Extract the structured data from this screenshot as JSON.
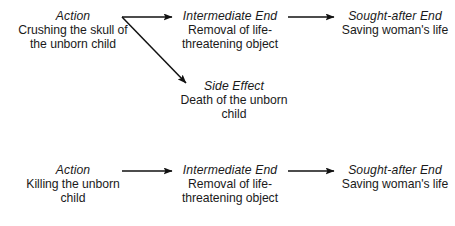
{
  "diagram": {
    "type": "flow-diagram",
    "background_color": "#ffffff",
    "text_color": "#1a1a1a",
    "rows": [
      {
        "id": "row-craniotomy",
        "nodes": [
          {
            "id": "action-1",
            "title": "Action",
            "body": "Crushing the skull of the unborn child"
          },
          {
            "id": "intermediate-end-1",
            "title": "Intermediate End",
            "body": "Removal of life-threatening object"
          },
          {
            "id": "sought-after-end-1",
            "title": "Sought-after End",
            "body": "Saving woman's life"
          },
          {
            "id": "side-effect-1",
            "title": "Side Effect",
            "body": "Death of the unborn child"
          }
        ]
      },
      {
        "id": "row-killing",
        "nodes": [
          {
            "id": "action-2",
            "title": "Action",
            "body": "Killing the unborn child"
          },
          {
            "id": "intermediate-end-2",
            "title": "Intermediate End",
            "body": "Removal of life-threatening object"
          },
          {
            "id": "sought-after-end-2",
            "title": "Sought-after End",
            "body": "Saving woman's life"
          }
        ]
      }
    ],
    "arrows": [
      {
        "id": "arrow-action1-to-intermediate1",
        "from": "action-1",
        "to": "intermediate-end-1",
        "x1": 122,
        "y1": 17,
        "x2": 172,
        "y2": 17
      },
      {
        "id": "arrow-action1-to-sideeffect1",
        "from": "action-1",
        "to": "side-effect-1",
        "x1": 122,
        "y1": 17,
        "x2": 186,
        "y2": 83
      },
      {
        "id": "arrow-intermediate1-to-sought1",
        "from": "intermediate-end-1",
        "to": "sought-after-end-1",
        "x1": 288,
        "y1": 17,
        "x2": 334,
        "y2": 17
      },
      {
        "id": "arrow-action2-to-intermediate2",
        "from": "action-2",
        "to": "intermediate-end-2",
        "x1": 122,
        "y1": 171,
        "x2": 172,
        "y2": 171
      },
      {
        "id": "arrow-intermediate2-to-sought2",
        "from": "intermediate-end-2",
        "to": "sought-after-end-2",
        "x1": 288,
        "y1": 171,
        "x2": 334,
        "y2": 171
      }
    ]
  }
}
